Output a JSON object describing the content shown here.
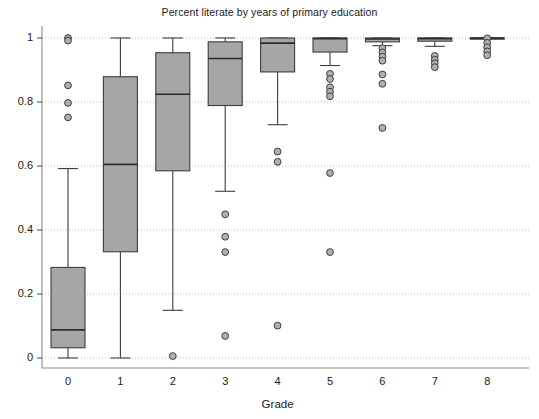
{
  "chart_data": {
    "type": "box",
    "title": "Percent literate by years of primary education",
    "xlabel": "Grade",
    "ylabel": "",
    "categories": [
      "0",
      "1",
      "2",
      "3",
      "4",
      "5",
      "6",
      "7",
      "8"
    ],
    "ylim": [
      -0.035,
      1.04
    ],
    "yticks": [
      0,
      0.2,
      0.4,
      0.6,
      0.8,
      1
    ],
    "ytick_labels": [
      "0",
      "0.2",
      "0.4",
      "0.6",
      "0.8",
      "1"
    ],
    "grid": "horizontal-dotted",
    "legend": "none",
    "box_fill": "#a6a6a6",
    "box_stroke": "#3d3d3d",
    "outlier_fill": "#b0b0b0",
    "boxes": [
      {
        "category": "0",
        "whisker_low": 0.0,
        "q1": 0.032,
        "median": 0.088,
        "q3": 0.283,
        "whisker_high": 0.592,
        "outliers": [
          1.0,
          0.992,
          0.852,
          0.797,
          0.752
        ]
      },
      {
        "category": "1",
        "whisker_low": 0.0,
        "q1": 0.332,
        "median": 0.605,
        "q3": 0.879,
        "whisker_high": 1.0,
        "outliers": []
      },
      {
        "category": "2",
        "whisker_low": 0.149,
        "q1": 0.585,
        "median": 0.824,
        "q3": 0.954,
        "whisker_high": 1.0,
        "outliers": [
          0.006
        ]
      },
      {
        "category": "3",
        "whisker_low": 0.521,
        "q1": 0.789,
        "median": 0.936,
        "q3": 0.988,
        "whisker_high": 1.0,
        "outliers": [
          0.449,
          0.379,
          0.331,
          0.069
        ]
      },
      {
        "category": "4",
        "whisker_low": 0.729,
        "q1": 0.894,
        "median": 0.984,
        "q3": 1.0,
        "whisker_high": 1.0,
        "outliers": [
          0.645,
          0.613,
          0.101
        ]
      },
      {
        "category": "5",
        "whisker_low": 0.914,
        "q1": 0.956,
        "median": 0.998,
        "q3": 1.0,
        "whisker_high": 1.0,
        "outliers": [
          0.888,
          0.872,
          0.846,
          0.832,
          0.818,
          0.578,
          0.331
        ]
      },
      {
        "category": "6",
        "whisker_low": 0.976,
        "q1": 0.988,
        "median": 0.997,
        "q3": 1.0,
        "whisker_high": 1.0,
        "outliers": [
          0.968,
          0.955,
          0.942,
          0.929,
          0.886,
          0.857,
          0.719
        ]
      },
      {
        "category": "7",
        "whisker_low": 0.974,
        "q1": 0.99,
        "median": 0.998,
        "q3": 1.0,
        "whisker_high": 1.0,
        "outliers": [
          0.944,
          0.932,
          0.921,
          0.909
        ]
      },
      {
        "category": "8",
        "whisker_low": 0.999,
        "q1": 0.999,
        "median": 1.0,
        "q3": 1.0,
        "whisker_high": 1.0,
        "outliers": [
          0.999,
          0.985,
          0.971,
          0.958,
          0.946
        ]
      }
    ]
  }
}
